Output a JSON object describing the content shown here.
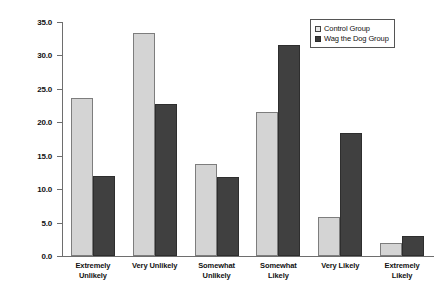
{
  "chart_data": {
    "type": "bar",
    "title": "",
    "xlabel": "",
    "ylabel": "Percent of Respondents",
    "ylim": [
      0.0,
      35.0
    ],
    "ytick_step": 5.0,
    "yticks": [
      "0.0",
      "5.0",
      "10.0",
      "15.0",
      "20.0",
      "25.0",
      "30.0",
      "35.0"
    ],
    "ytick_values": [
      0.0,
      5.0,
      10.0,
      15.0,
      20.0,
      25.0,
      30.0,
      35.0
    ],
    "grid": false,
    "legend_position": "top-right",
    "categories": [
      "Extremely Unlikely",
      "Very Unlikely",
      "Somewhat Unlikely",
      "Somewhat Likely",
      "Very Likely",
      "Extremely Likely"
    ],
    "category_lines": [
      [
        "Extremely",
        "Unlikely"
      ],
      [
        "Very Unlikely",
        ""
      ],
      [
        "Somewhat",
        "Unlikely"
      ],
      [
        "Somewhat",
        "Likely"
      ],
      [
        "Very Likely",
        ""
      ],
      [
        "Extremely",
        "Likely"
      ]
    ],
    "series": [
      {
        "name": "Control Group",
        "color": "#d4d4d4",
        "values": [
          23.7,
          33.3,
          13.7,
          21.5,
          5.8,
          2.0
        ]
      },
      {
        "name": "Wag the Dog Group",
        "color": "#404040",
        "values": [
          12.0,
          22.8,
          11.8,
          31.6,
          18.4,
          3.0
        ]
      }
    ]
  },
  "legend": {
    "items": [
      {
        "label": "Control Group"
      },
      {
        "label": "Wag the Dog Group"
      }
    ]
  },
  "caption": {
    "text": ""
  }
}
